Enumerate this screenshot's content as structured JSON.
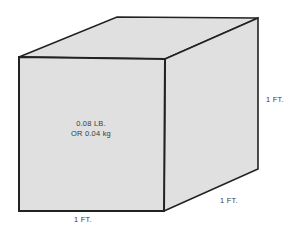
{
  "diagram": {
    "type": "cube-illustration",
    "weight_line_1": "0.08 LB.",
    "weight_line_2": "OR 0.04 kg",
    "dimension_labels": {
      "height": "1 FT.",
      "width": "1 FT.",
      "depth": "1 FT."
    },
    "colors": {
      "face": "#e0e0e0",
      "outline": "#222222",
      "text": "#3a3a3a",
      "background": "#ffffff"
    }
  }
}
